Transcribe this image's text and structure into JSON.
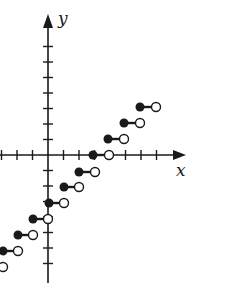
{
  "diagram": {
    "type": "step-function-graph",
    "axes": {
      "x_label": "x",
      "y_label": "y",
      "origin_px": [
        48,
        155
      ],
      "unit_px": 15.5,
      "x_ticks": [
        -3,
        -2,
        -1,
        1,
        2,
        3,
        4,
        5,
        6,
        7
      ],
      "y_ticks": [
        7,
        6,
        5,
        4,
        3,
        2,
        1,
        -1,
        -2,
        -3,
        -4,
        -5,
        -6,
        -7
      ]
    },
    "colors": {
      "stroke": "#1a1a1a",
      "background": "#ffffff"
    },
    "steps": [
      {
        "x_start": -3,
        "x_end": -2,
        "y": -6
      },
      {
        "x_start": -3,
        "x_end": -2,
        "y": -5
      },
      {
        "x_start": -2,
        "x_end": -1,
        "y": -4
      },
      {
        "x_start": -1,
        "x_end": 0,
        "y": -3
      },
      {
        "x_start": 0,
        "x_end": 1,
        "y": -2
      },
      {
        "x_start": 1,
        "x_end": 2,
        "y": -1
      },
      {
        "x_start": 2,
        "x_end": 3,
        "y": 0
      },
      {
        "x_start": 3,
        "x_end": 4,
        "y": 1
      },
      {
        "x_start": 4,
        "x_end": 5,
        "y": 2
      },
      {
        "x_start": 5,
        "x_end": 6,
        "y": 3
      }
    ]
  }
}
